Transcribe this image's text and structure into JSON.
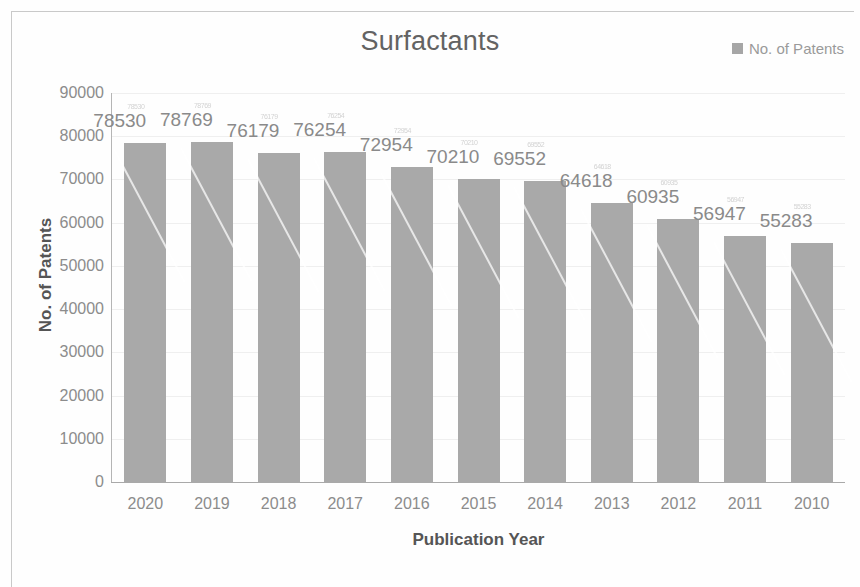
{
  "chart_data": {
    "type": "bar",
    "title": "Surfactants",
    "xlabel": "Publication Year",
    "ylabel": "No. of Patents",
    "categories": [
      "2020",
      "2019",
      "2018",
      "2017",
      "2016",
      "2015",
      "2014",
      "2013",
      "2012",
      "2011",
      "2010"
    ],
    "values": [
      78530,
      78769,
      76179,
      76254,
      72954,
      70210,
      69552,
      64618,
      60935,
      56947,
      55283
    ],
    "series": [
      {
        "name": "No. of Patents",
        "values": [
          78530,
          78769,
          76179,
          76254,
          72954,
          70210,
          69552,
          64618,
          60935,
          56947,
          55283
        ]
      }
    ],
    "ylim": [
      0,
      90000
    ],
    "ytick_labels": [
      "90000",
      "80000",
      "70000",
      "60000",
      "50000",
      "40000",
      "30000",
      "20000",
      "10000",
      "0"
    ],
    "ytick_values": [
      90000,
      80000,
      70000,
      60000,
      50000,
      40000,
      30000,
      20000,
      10000,
      0
    ],
    "grid": true,
    "legend": [
      "No. of Patents"
    ],
    "legend_position": "top-right",
    "bar_color": "#a9a9a9",
    "data_labels_shown": true
  },
  "legend": {
    "label": "No. of Patents",
    "swatch_color": "#a6a6a6",
    "swatch_icon": "square-swatch-icon"
  },
  "axes": {
    "y_title": "No. of Patents",
    "x_title": "Publication Year"
  }
}
